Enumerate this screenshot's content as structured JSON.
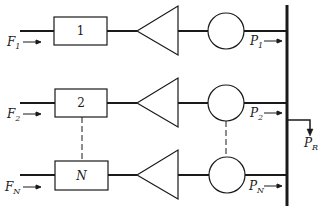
{
  "diagram": {
    "type": "block-diagram",
    "colors": {
      "stroke": "#1a1a1a",
      "background": "#ffffff"
    },
    "units": [
      {
        "id": "1",
        "box_label": "1",
        "input_label": "F",
        "input_sub": "1",
        "output_label": "P",
        "output_sub": "1"
      },
      {
        "id": "2",
        "box_label": "2",
        "input_label": "F",
        "input_sub": "2",
        "output_label": "P",
        "output_sub": "2"
      },
      {
        "id": "N",
        "box_label": "N",
        "input_label": "F",
        "input_sub": "N",
        "output_label": "P",
        "output_sub": "N"
      }
    ],
    "bus_output": {
      "label": "P",
      "sub": "R"
    },
    "arrow_glyph": "→"
  }
}
